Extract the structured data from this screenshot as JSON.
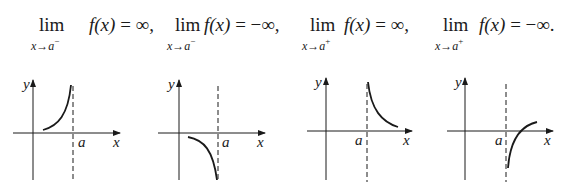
{
  "formulas": [
    {
      "lim": "lim",
      "sub_var": "x",
      "arrow": "→",
      "sub_pt": "a",
      "side": "−",
      "func": "f",
      "arg": "(x)",
      "eq": " = ",
      "result": "∞,"
    },
    {
      "lim": "lim",
      "sub_var": "x",
      "arrow": "→",
      "sub_pt": "a",
      "side": "−",
      "func": "f",
      "arg": "(x)",
      "eq": " = ",
      "result": "−∞,"
    },
    {
      "lim": "lim",
      "sub_var": "x",
      "arrow": "→",
      "sub_pt": "a",
      "side": "+",
      "func": "f",
      "arg": "(x)",
      "eq": " = ",
      "result": "∞,"
    },
    {
      "lim": "lim",
      "sub_var": "x",
      "arrow": "→",
      "sub_pt": "a",
      "side": "+",
      "func": "f",
      "arg": "(x)",
      "eq": " = ",
      "result": "−∞."
    }
  ],
  "graphs": [
    {
      "y_label": "y",
      "x_label": "x",
      "asymptote_label": "a",
      "description": "curve rises to +∞ approaching a from the left"
    },
    {
      "y_label": "y",
      "x_label": "x",
      "asymptote_label": "a",
      "description": "curve falls to −∞ approaching a from the left"
    },
    {
      "y_label": "y",
      "x_label": "x",
      "asymptote_label": "a",
      "description": "curve rises to +∞ approaching a from the right"
    },
    {
      "y_label": "y",
      "x_label": "x",
      "asymptote_label": "a",
      "description": "curve falls to −∞ approaching a from the right"
    }
  ],
  "colors": {
    "ink": "#1a1a1a",
    "background": "#ffffff"
  }
}
